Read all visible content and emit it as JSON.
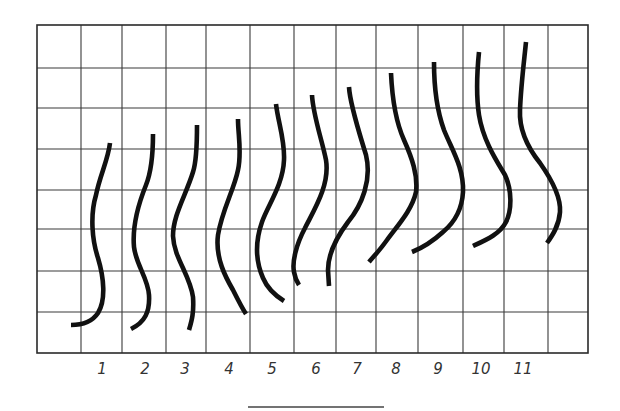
{
  "figure": {
    "colors": {
      "background": "#ffffff",
      "grid": "#3a3a3a",
      "curve": "#111111",
      "label": "#333333"
    },
    "grid": {
      "columns_x": [
        37,
        81,
        122,
        166,
        206,
        250,
        294,
        336,
        376,
        418,
        463,
        504,
        548,
        588
      ],
      "rows_y": [
        25,
        68,
        108,
        149,
        190,
        229,
        271,
        312,
        353
      ],
      "columns": 13,
      "rows": 8
    },
    "labels": [
      {
        "text": "1",
        "x": 102
      },
      {
        "text": "2",
        "x": 145
      },
      {
        "text": "3",
        "x": 185
      },
      {
        "text": "4",
        "x": 229
      },
      {
        "text": "5",
        "x": 272
      },
      {
        "text": "6",
        "x": 316
      },
      {
        "text": "7",
        "x": 357
      },
      {
        "text": "8",
        "x": 396
      },
      {
        "text": "9",
        "x": 438
      },
      {
        "text": "10",
        "x": 481
      },
      {
        "text": "11",
        "x": 523
      }
    ],
    "labels_y": 374,
    "curves": [
      {
        "id": "1",
        "d": "M110,143 C108,160 100,175 96,195 C90,215 92,240 98,258 C104,278 106,300 98,313 C92,322 82,325 71,325"
      },
      {
        "id": "2",
        "d": "M153,134 C153,150 152,170 146,185 C138,205 132,225 134,247 C136,265 148,278 149,295 C150,312 145,322 131,329"
      },
      {
        "id": "3",
        "d": "M197,125 C197,140 197,160 193,172 C186,195 173,215 173,236 C174,258 190,275 193,297 C194,312 192,320 189,330"
      },
      {
        "id": "4",
        "d": "M238,119 C238,135 242,152 238,170 C234,190 222,210 218,235 C215,258 226,278 233,290 C238,300 242,308 246,314"
      },
      {
        "id": "5",
        "d": "M276,104 C278,122 285,140 284,160 C283,185 268,205 262,222 C255,242 256,262 263,278 C268,290 276,296 284,301"
      },
      {
        "id": "6",
        "d": "M312,95 C313,115 322,140 326,160 C330,185 314,210 305,228 C296,245 292,262 294,272 C295,278 297,282 299,285"
      },
      {
        "id": "7",
        "d": "M349,87 C350,105 360,135 366,155 C372,180 362,205 348,222 C336,238 328,255 328,270 L329,286"
      },
      {
        "id": "8",
        "d": "M391,73 C392,95 395,120 404,140 C412,158 418,175 416,192 C412,210 398,225 387,240 C380,250 374,256 369,262"
      },
      {
        "id": "9",
        "d": "M434,62 C434,85 436,108 444,130 C452,150 464,168 463,192 C462,210 455,222 443,232 C432,242 422,248 412,252"
      },
      {
        "id": "10",
        "d": "M479,52 C477,72 476,95 479,115 C483,140 496,160 505,175 C512,190 512,210 506,222 C500,234 486,240 473,246"
      },
      {
        "id": "11",
        "d": "M526,42 C524,62 521,85 520,110 C519,130 528,148 540,163 C552,180 561,198 560,212 C559,226 552,236 547,243"
      }
    ],
    "scale_bar": {
      "x1": 248,
      "x2": 384,
      "y": 407
    }
  }
}
